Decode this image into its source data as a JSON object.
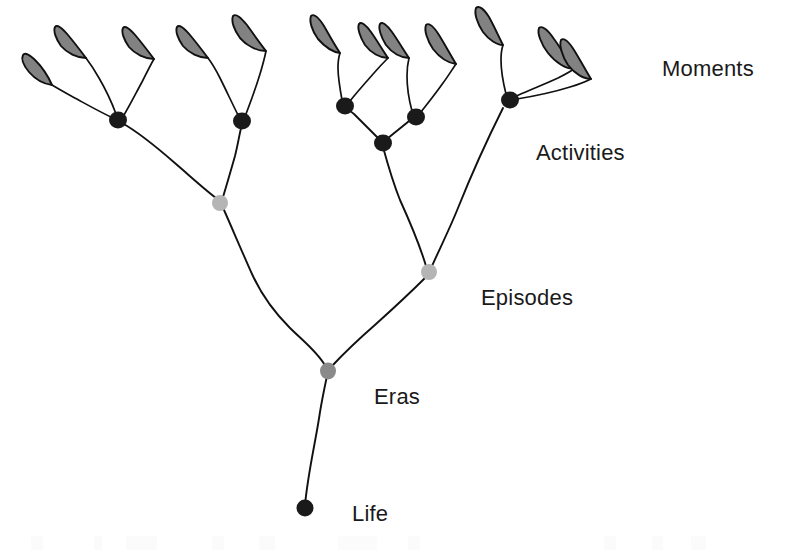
{
  "figure": {
    "background_color": "#ffffff",
    "width": 785,
    "height": 550
  },
  "style": {
    "branch_color": "#111111",
    "leaf_fill": "#828282",
    "leaf_stroke": "#111111",
    "node_black": "#1a1a1a",
    "node_mid_gray": "#8a8a8a",
    "node_light_gray": "#b5b5b5",
    "label_color": "#1a1a1a"
  },
  "labels": [
    {
      "id": "moments",
      "text": "Moments",
      "x": 662,
      "y": 76,
      "level": 1
    },
    {
      "id": "activities",
      "text": "Activities",
      "x": 536,
      "y": 160,
      "level": 2
    },
    {
      "id": "episodes",
      "text": "Episodes",
      "x": 481,
      "y": 305,
      "level": 3
    },
    {
      "id": "eras",
      "text": "Eras",
      "x": 374,
      "y": 404,
      "level": 4
    },
    {
      "id": "life",
      "text": "Life",
      "x": 352,
      "y": 521,
      "level": 5
    }
  ],
  "nodes": [
    {
      "id": "life-root",
      "tier": "Life",
      "x": 305,
      "y": 508,
      "r": 8.0,
      "color": "#1a1a1a"
    },
    {
      "id": "eras-1",
      "tier": "Eras",
      "x": 328,
      "y": 371,
      "r": 7.5,
      "color": "#8a8a8a"
    },
    {
      "id": "episodes-1",
      "tier": "Episodes",
      "x": 220,
      "y": 203,
      "r": 7.5,
      "color": "#b5b5b5"
    },
    {
      "id": "episodes-2",
      "tier": "Episodes",
      "x": 429,
      "y": 272,
      "r": 7.5,
      "color": "#b5b5b5"
    },
    {
      "id": "activities-1",
      "tier": "Activities",
      "x": 118,
      "y": 120,
      "r": 8.5,
      "color": "#1a1a1a"
    },
    {
      "id": "activities-2",
      "tier": "Activities",
      "x": 242,
      "y": 121,
      "r": 8.5,
      "color": "#1a1a1a"
    },
    {
      "id": "activities-3",
      "tier": "Activities",
      "x": 345,
      "y": 106,
      "r": 8.5,
      "color": "#1a1a1a"
    },
    {
      "id": "activities-4",
      "tier": "Activities",
      "x": 383,
      "y": 143,
      "r": 8.5,
      "color": "#1a1a1a"
    },
    {
      "id": "activities-5",
      "tier": "Activities",
      "x": 416,
      "y": 117,
      "r": 8.5,
      "color": "#1a1a1a"
    },
    {
      "id": "activities-6",
      "tier": "Activities",
      "x": 510,
      "y": 100,
      "r": 8.5,
      "color": "#1a1a1a"
    }
  ],
  "leaves": [
    {
      "id": "leaf-1",
      "tier": "Moments",
      "parent": "activities-1",
      "tip_x": 28,
      "tip_y": 57
    },
    {
      "id": "leaf-2",
      "tier": "Moments",
      "parent": "activities-1",
      "tip_x": 62,
      "tip_y": 32
    },
    {
      "id": "leaf-3",
      "tier": "Moments",
      "parent": "activities-1",
      "tip_x": 127,
      "tip_y": 33
    },
    {
      "id": "leaf-4",
      "tier": "Moments",
      "parent": "activities-2",
      "tip_x": 183,
      "tip_y": 33
    },
    {
      "id": "leaf-5",
      "tier": "Moments",
      "parent": "activities-2",
      "tip_x": 237,
      "tip_y": 24
    },
    {
      "id": "leaf-6",
      "tier": "Moments",
      "parent": "activities-3",
      "tip_x": 326,
      "tip_y": 27
    },
    {
      "id": "leaf-7",
      "tier": "Moments",
      "parent": "activities-3",
      "tip_x": 372,
      "tip_y": 31
    },
    {
      "id": "leaf-8",
      "tier": "Moments",
      "parent": "activities-5",
      "tip_x": 409,
      "tip_y": 31
    },
    {
      "id": "leaf-9",
      "tier": "Moments",
      "parent": "activities-5",
      "tip_x": 452,
      "tip_y": 28
    },
    {
      "id": "leaf-10",
      "tier": "Moments",
      "parent": "activities-6",
      "tip_x": 490,
      "tip_y": 24
    },
    {
      "id": "leaf-11",
      "tier": "Moments",
      "parent": "activities-6",
      "tip_x": 546,
      "tip_y": 24
    },
    {
      "id": "leaf-12",
      "tier": "Moments",
      "parent": "activities-6",
      "tip_x": 578,
      "tip_y": 28
    }
  ],
  "hierarchy": {
    "levels": [
      "Life",
      "Eras",
      "Episodes",
      "Activities",
      "Moments"
    ],
    "counts": {
      "Life": 1,
      "Eras": 1,
      "Episodes": 2,
      "Activities": 6,
      "Moments": 12
    }
  }
}
